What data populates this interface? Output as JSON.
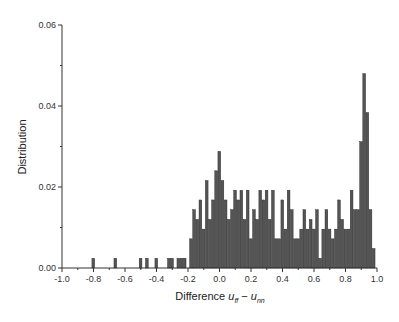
{
  "chart_data": {
    "type": "bar",
    "title": "",
    "xlabel": "Difference u_ff − u_nn",
    "xlabel_parts": {
      "prefix": "Difference ",
      "var1": "u",
      "sub1": "ff",
      "minus": " − ",
      "var2": "u",
      "sub2": "nn"
    },
    "ylabel": "Distribution",
    "xlim": [
      -1.0,
      1.0
    ],
    "ylim": [
      0.0,
      0.06
    ],
    "xticks": [
      "-1.0",
      "-0.8",
      "-0.6",
      "-0.4",
      "-0.2",
      "0.0",
      "0.2",
      "0.4",
      "0.6",
      "0.8",
      "1.0"
    ],
    "yticks": [
      "0.00",
      "0.02",
      "0.04",
      "0.06"
    ],
    "bin_width": 0.02,
    "grid": false,
    "legend": null,
    "bar_color": "#555555",
    "bar_edge": "#222222",
    "bins": [
      {
        "x": -0.8,
        "y": 0.0024
      },
      {
        "x": -0.66,
        "y": 0.0024
      },
      {
        "x": -0.5,
        "y": 0.0024
      },
      {
        "x": -0.46,
        "y": 0.0024
      },
      {
        "x": -0.4,
        "y": 0.0024
      },
      {
        "x": -0.32,
        "y": 0.0024
      },
      {
        "x": -0.3,
        "y": 0.0024
      },
      {
        "x": -0.26,
        "y": 0.0024
      },
      {
        "x": -0.24,
        "y": 0.0024
      },
      {
        "x": -0.22,
        "y": 0.0024
      },
      {
        "x": -0.18,
        "y": 0.0072
      },
      {
        "x": -0.16,
        "y": 0.0144
      },
      {
        "x": -0.14,
        "y": 0.012
      },
      {
        "x": -0.12,
        "y": 0.0168
      },
      {
        "x": -0.1,
        "y": 0.0096
      },
      {
        "x": -0.08,
        "y": 0.0216
      },
      {
        "x": -0.06,
        "y": 0.012
      },
      {
        "x": -0.04,
        "y": 0.0168
      },
      {
        "x": -0.02,
        "y": 0.024
      },
      {
        "x": 0.0,
        "y": 0.0288
      },
      {
        "x": 0.02,
        "y": 0.0216
      },
      {
        "x": 0.04,
        "y": 0.0168
      },
      {
        "x": 0.06,
        "y": 0.012
      },
      {
        "x": 0.08,
        "y": 0.0144
      },
      {
        "x": 0.1,
        "y": 0.0192
      },
      {
        "x": 0.12,
        "y": 0.0168
      },
      {
        "x": 0.14,
        "y": 0.0192
      },
      {
        "x": 0.16,
        "y": 0.012
      },
      {
        "x": 0.18,
        "y": 0.0192
      },
      {
        "x": 0.2,
        "y": 0.0072
      },
      {
        "x": 0.22,
        "y": 0.0144
      },
      {
        "x": 0.24,
        "y": 0.012
      },
      {
        "x": 0.26,
        "y": 0.0192
      },
      {
        "x": 0.28,
        "y": 0.0168
      },
      {
        "x": 0.3,
        "y": 0.0192
      },
      {
        "x": 0.32,
        "y": 0.012
      },
      {
        "x": 0.34,
        "y": 0.0192
      },
      {
        "x": 0.36,
        "y": 0.0072
      },
      {
        "x": 0.38,
        "y": 0.0072
      },
      {
        "x": 0.4,
        "y": 0.0168
      },
      {
        "x": 0.42,
        "y": 0.0096
      },
      {
        "x": 0.44,
        "y": 0.0192
      },
      {
        "x": 0.46,
        "y": 0.0144
      },
      {
        "x": 0.48,
        "y": 0.0072
      },
      {
        "x": 0.5,
        "y": 0.0072
      },
      {
        "x": 0.52,
        "y": 0.0096
      },
      {
        "x": 0.54,
        "y": 0.0144
      },
      {
        "x": 0.56,
        "y": 0.0096
      },
      {
        "x": 0.58,
        "y": 0.012
      },
      {
        "x": 0.6,
        "y": 0.0096
      },
      {
        "x": 0.62,
        "y": 0.0144
      },
      {
        "x": 0.64,
        "y": 0.0024
      },
      {
        "x": 0.66,
        "y": 0.0096
      },
      {
        "x": 0.68,
        "y": 0.0144
      },
      {
        "x": 0.7,
        "y": 0.0096
      },
      {
        "x": 0.72,
        "y": 0.0072
      },
      {
        "x": 0.74,
        "y": 0.0096
      },
      {
        "x": 0.76,
        "y": 0.0168
      },
      {
        "x": 0.78,
        "y": 0.012
      },
      {
        "x": 0.8,
        "y": 0.0096
      },
      {
        "x": 0.82,
        "y": 0.0096
      },
      {
        "x": 0.84,
        "y": 0.0192
      },
      {
        "x": 0.86,
        "y": 0.0144
      },
      {
        "x": 0.88,
        "y": 0.0144
      },
      {
        "x": 0.9,
        "y": 0.0312
      },
      {
        "x": 0.92,
        "y": 0.048
      },
      {
        "x": 0.94,
        "y": 0.0384
      },
      {
        "x": 0.96,
        "y": 0.0144
      },
      {
        "x": 0.98,
        "y": 0.0048
      }
    ]
  }
}
